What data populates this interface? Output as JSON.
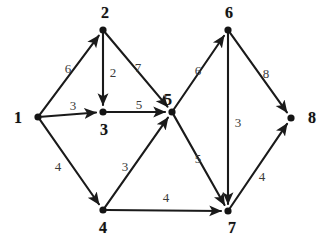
{
  "figure": {
    "kind": "weighted-directed-graph",
    "background_color": "#ffffff",
    "node_color": "#141414",
    "edge_color": "#1a1a1a",
    "label_color": "#121212",
    "weight_color": "#3a3a3a",
    "width": 330,
    "height": 246
  },
  "graph": {
    "nodes": [
      {
        "id": "1",
        "label": "1",
        "x": 38,
        "y": 117,
        "label_x": 18,
        "label_y": 118
      },
      {
        "id": "2",
        "label": "2",
        "x": 103,
        "y": 30,
        "label_x": 105,
        "label_y": 13
      },
      {
        "id": "3",
        "label": "3",
        "x": 103,
        "y": 112,
        "label_x": 104,
        "label_y": 130
      },
      {
        "id": "4",
        "label": "4",
        "x": 103,
        "y": 210,
        "label_x": 103,
        "label_y": 228
      },
      {
        "id": "5",
        "label": "5",
        "x": 172,
        "y": 112,
        "label_x": 168,
        "label_y": 100
      },
      {
        "id": "6",
        "label": "6",
        "x": 228,
        "y": 30,
        "label_x": 229,
        "label_y": 13
      },
      {
        "id": "7",
        "label": "7",
        "x": 228,
        "y": 211,
        "label_x": 232,
        "label_y": 228
      },
      {
        "id": "8",
        "label": "8",
        "x": 291,
        "y": 118,
        "label_x": 312,
        "label_y": 118
      }
    ],
    "edges": [
      {
        "from": "1",
        "to": "2",
        "weight": "6",
        "label_x": 68,
        "label_y": 68
      },
      {
        "from": "1",
        "to": "3",
        "weight": "3",
        "label_x": 73,
        "label_y": 105
      },
      {
        "from": "1",
        "to": "4",
        "weight": "4",
        "label_x": 58,
        "label_y": 166
      },
      {
        "from": "2",
        "to": "3",
        "weight": "2",
        "label_x": 113,
        "label_y": 72
      },
      {
        "from": "2",
        "to": "5",
        "weight": "7",
        "label_x": 138,
        "label_y": 67
      },
      {
        "from": "3",
        "to": "5",
        "weight": "5",
        "label_x": 139,
        "label_y": 104
      },
      {
        "from": "4",
        "to": "5",
        "weight": "3",
        "label_x": 125,
        "label_y": 166
      },
      {
        "from": "4",
        "to": "7",
        "weight": "4",
        "label_x": 166,
        "label_y": 197
      },
      {
        "from": "5",
        "to": "6",
        "weight": "6",
        "label_x": 198,
        "label_y": 70
      },
      {
        "from": "5",
        "to": "7",
        "weight": "5",
        "label_x": 198,
        "label_y": 158
      },
      {
        "from": "6",
        "to": "7",
        "weight": "3",
        "label_x": 238,
        "label_y": 122
      },
      {
        "from": "6",
        "to": "8",
        "weight": "8",
        "label_x": 266,
        "label_y": 73
      },
      {
        "from": "7",
        "to": "8",
        "weight": "4",
        "label_x": 262,
        "label_y": 176
      }
    ]
  }
}
